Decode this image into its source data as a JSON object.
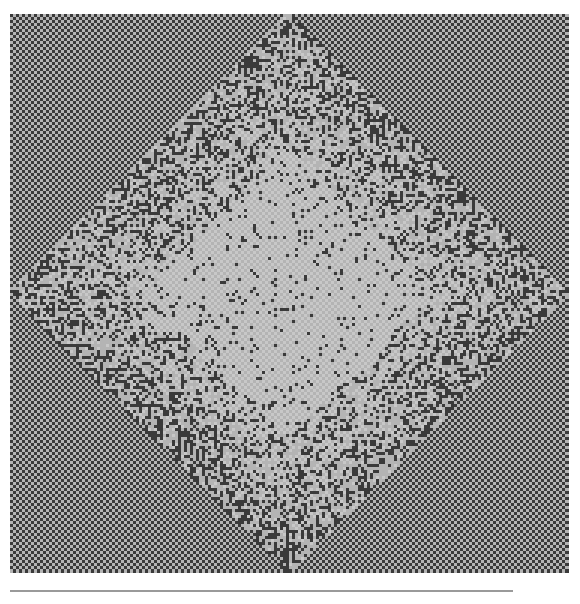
{
  "figure": {
    "colors": {
      "background": "#ffffff",
      "dark": "#3a3a3a",
      "mid": "#6e6e6e",
      "light": "#b4b4b4",
      "lighter": "#c8c8c8",
      "rule": "#9a9a9a"
    },
    "grid_cells": 186,
    "cell_px": 3,
    "diamond": {
      "center": [
        0.5,
        0.5
      ],
      "inner_radius": 0.26,
      "outer_radius": 0.5
    },
    "corner_stripes": {
      "top_left": "down-right",
      "top_right": "down-left",
      "bottom_left": "down-left",
      "bottom_right": "down-right"
    }
  }
}
